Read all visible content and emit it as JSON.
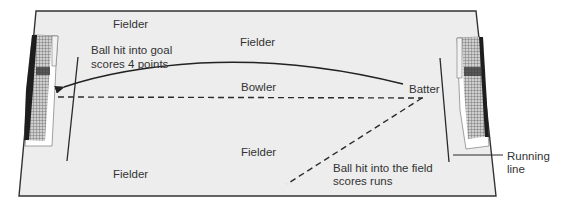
{
  "diagram": {
    "colors": {
      "field_fill": "#ededed",
      "field_border": "#333333",
      "line": "#2a2a2a",
      "text": "#333333",
      "goal_net": "#8a8a8a",
      "goal_dark": "#222222",
      "goal_frame": "#ffffff"
    },
    "labels": {
      "fielder_top_left": "Fielder",
      "fielder_top_center": "Fielder",
      "fielder_center": "Fielder",
      "fielder_bottom_left": "Fielder",
      "bowler": "Bowler",
      "batter": "Batter",
      "goal_note_line1": "Ball hit into goal",
      "goal_note_line2": "scores 4 points",
      "field_note_line1": "Ball hit into the field",
      "field_note_line2": "scores runs",
      "running_line_line1": "Running",
      "running_line_line2": "line"
    },
    "elements": {
      "left_goal": "goal-net",
      "right_goal": "goal-net",
      "left_running_line": "running-line",
      "right_running_line": "running-line",
      "pitch_line": "dashed-bowling-line",
      "ball_path_goal": "solid-arrow-curve",
      "ball_path_field": "dashed-line"
    }
  }
}
